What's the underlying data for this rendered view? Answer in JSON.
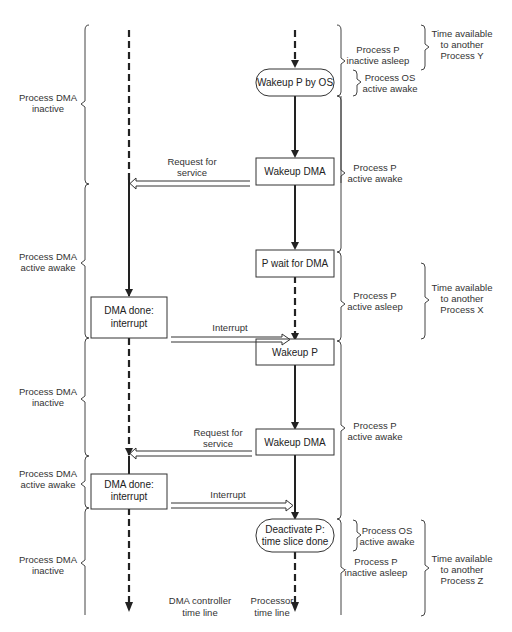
{
  "diagram": {
    "title": "",
    "timelines": {
      "dma": {
        "label_line1": "DMA controller",
        "label_line2": "time line"
      },
      "processor": {
        "label_line1": "Processor",
        "label_line2": "time line"
      }
    },
    "processor_nodes": [
      {
        "id": "wakeup-p-by-os",
        "shape": "rounded",
        "line1": "Wakeup P by OS",
        "line2": ""
      },
      {
        "id": "wakeup-dma-1",
        "shape": "rect",
        "line1": "Wakeup DMA",
        "line2": ""
      },
      {
        "id": "p-wait-for-dma",
        "shape": "rect",
        "line1": "P wait for DMA",
        "line2": ""
      },
      {
        "id": "wakeup-p",
        "shape": "rect",
        "line1": "Wakeup P",
        "line2": ""
      },
      {
        "id": "wakeup-dma-2",
        "shape": "rect",
        "line1": "Wakeup DMA",
        "line2": ""
      },
      {
        "id": "deactivate-p",
        "shape": "rounded",
        "line1": "Deactivate P:",
        "line2": "time slice done"
      }
    ],
    "dma_nodes": [
      {
        "id": "dma-done-1",
        "line1": "DMA done:",
        "line2": "interrupt"
      },
      {
        "id": "dma-done-2",
        "line1": "DMA done:",
        "line2": "interrupt"
      }
    ],
    "messages": [
      {
        "id": "request-1",
        "line1": "Request for",
        "line2": "service",
        "direction": "processor-to-dma"
      },
      {
        "id": "interrupt-1",
        "line1": "Interrupt",
        "line2": "",
        "direction": "dma-to-processor"
      },
      {
        "id": "request-2",
        "line1": "Request for",
        "line2": "service",
        "direction": "processor-to-dma"
      },
      {
        "id": "interrupt-2",
        "line1": "Interrupt",
        "line2": "",
        "direction": "dma-to-processor"
      }
    ],
    "dma_states": [
      {
        "line1": "Process DMA",
        "line2": "inactive"
      },
      {
        "line1": "Process DMA",
        "line2": "active awake"
      },
      {
        "line1": "Process DMA",
        "line2": "inactive"
      },
      {
        "line1": "Process DMA",
        "line2": "active awake"
      },
      {
        "line1": "Process DMA",
        "line2": "inactive"
      }
    ],
    "p_states": [
      {
        "line1": "Process P",
        "line2": "inactive asleep"
      },
      {
        "line1": "Process OS",
        "line2": "active awake"
      },
      {
        "line1": "Process P",
        "line2": "active awake"
      },
      {
        "line1": "Process P",
        "line2": "active asleep"
      },
      {
        "line1": "Process P",
        "line2": "active awake"
      },
      {
        "line1": "Process OS",
        "line2": "active awake"
      },
      {
        "line1": "Process P",
        "line2": "inactive asleep"
      }
    ],
    "time_available": [
      {
        "line1": "Time available",
        "line2": "to another",
        "line3": "Process Y"
      },
      {
        "line1": "Time available",
        "line2": "to another",
        "line3": "Process X"
      },
      {
        "line1": "Time available",
        "line2": "to another",
        "line3": "Process Z"
      }
    ]
  }
}
